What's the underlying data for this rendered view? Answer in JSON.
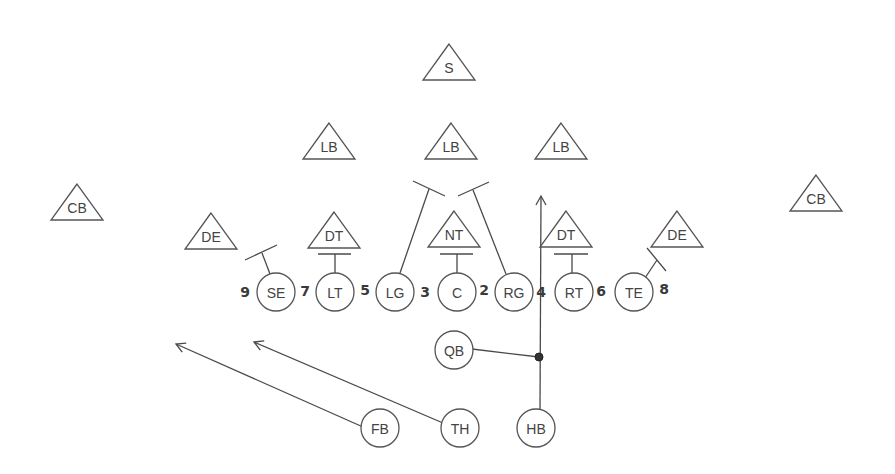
{
  "diagram": {
    "type": "football-play",
    "defense": [
      {
        "id": "s",
        "label": "S",
        "x": 449,
        "y": 44
      },
      {
        "id": "lb-left",
        "label": "LB",
        "x": 329,
        "y": 123
      },
      {
        "id": "lb-middle",
        "label": "LB",
        "x": 451,
        "y": 123
      },
      {
        "id": "lb-right",
        "label": "LB",
        "x": 561,
        "y": 123
      },
      {
        "id": "cb-left",
        "label": "CB",
        "x": 77,
        "y": 184
      },
      {
        "id": "cb-right",
        "label": "CB",
        "x": 816,
        "y": 175
      },
      {
        "id": "de-left",
        "label": "DE",
        "x": 211,
        "y": 213
      },
      {
        "id": "dt-left",
        "label": "DT",
        "x": 334,
        "y": 212
      },
      {
        "id": "nt",
        "label": "NT",
        "x": 454,
        "y": 211
      },
      {
        "id": "dt-right",
        "label": "DT",
        "x": 566,
        "y": 211
      },
      {
        "id": "de-right",
        "label": "DE",
        "x": 677,
        "y": 211
      }
    ],
    "offense": [
      {
        "id": "se",
        "label": "SE",
        "x": 276,
        "y": 292
      },
      {
        "id": "lt",
        "label": "LT",
        "x": 335,
        "y": 292
      },
      {
        "id": "lg",
        "label": "LG",
        "x": 395,
        "y": 292
      },
      {
        "id": "c",
        "label": "C",
        "x": 457,
        "y": 292
      },
      {
        "id": "rg",
        "label": "RG",
        "x": 514,
        "y": 292
      },
      {
        "id": "rt",
        "label": "RT",
        "x": 574,
        "y": 292
      },
      {
        "id": "te",
        "label": "TE",
        "x": 634,
        "y": 292
      },
      {
        "id": "qb",
        "label": "QB",
        "x": 454,
        "y": 350
      },
      {
        "id": "fb",
        "label": "FB",
        "x": 380,
        "y": 428
      },
      {
        "id": "th",
        "label": "TH",
        "x": 460,
        "y": 428
      },
      {
        "id": "hb",
        "label": "HB",
        "x": 536,
        "y": 428
      }
    ],
    "hole_numbers": [
      {
        "label": "9",
        "x": 245,
        "y": 292
      },
      {
        "label": "7",
        "x": 305,
        "y": 291
      },
      {
        "label": "5",
        "x": 365,
        "y": 290
      },
      {
        "label": "3",
        "x": 425,
        "y": 292
      },
      {
        "label": "2",
        "x": 484,
        "y": 290
      },
      {
        "label": "4",
        "x": 541,
        "y": 292
      },
      {
        "label": "6",
        "x": 601,
        "y": 291
      },
      {
        "label": "8",
        "x": 664,
        "y": 289
      }
    ]
  }
}
